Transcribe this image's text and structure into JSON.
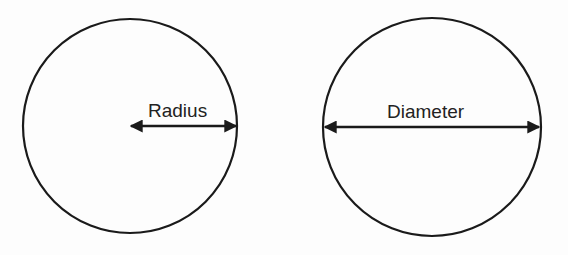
{
  "diagram": {
    "circles": [
      {
        "label": "Radius",
        "cx": 130,
        "cy": 126,
        "r": 107
      },
      {
        "label": "Diameter",
        "cx": 432,
        "cy": 127,
        "r": 109
      }
    ],
    "stroke_color": "#1a1a1a"
  }
}
